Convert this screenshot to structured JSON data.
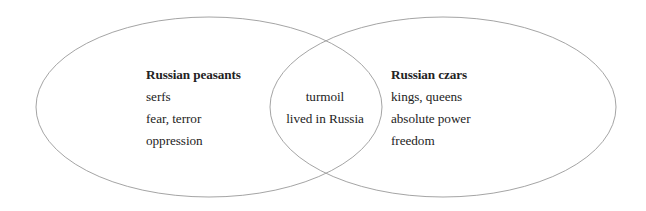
{
  "diagram": {
    "type": "venn",
    "background_color": "#ffffff",
    "outline_color": "#9a9a9a",
    "text_color": "#232323",
    "left_set": {
      "title": "Russian peasants",
      "items": [
        "serfs",
        "fear, terror",
        "oppression"
      ]
    },
    "right_set": {
      "title": "Russian czars",
      "items": [
        "kings, queens",
        "absolute power",
        "freedom"
      ]
    },
    "intersection": {
      "title": "",
      "items": [
        "turmoil",
        "lived in Russia"
      ]
    }
  }
}
